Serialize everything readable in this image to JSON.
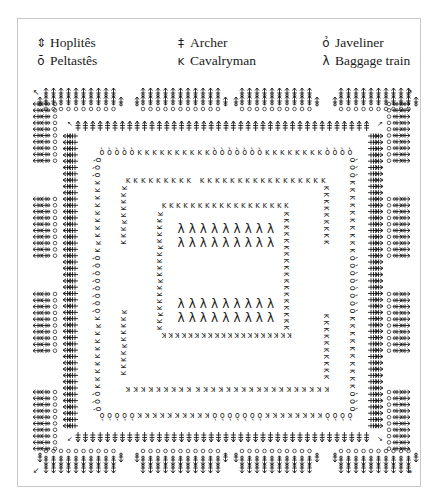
{
  "legend": {
    "items": [
      {
        "key": "hoplites",
        "glyph": "⇕",
        "label": "Hoplitês",
        "x": 0,
        "y": 0
      },
      {
        "key": "peltastes",
        "glyph": "ō",
        "label": "Peltastês",
        "x": 0,
        "y": 18
      },
      {
        "key": "archer",
        "glyph": "‡",
        "label": "Archer",
        "x": 140,
        "y": 0
      },
      {
        "key": "cavalryman",
        "glyph": "ĸ",
        "label": "Cavalryman",
        "x": 140,
        "y": 18
      },
      {
        "key": "javeliner",
        "glyph": "ỏ",
        "label": "Javeliner",
        "x": 285,
        "y": 0
      },
      {
        "key": "baggage",
        "glyph": "λ",
        "label": "Baggage train",
        "x": 285,
        "y": 18
      }
    ]
  },
  "formation": {
    "description": "Hollow-square marching formation",
    "outer_blocks_top": [
      {
        "x": 40,
        "n": 10
      },
      {
        "x": 137,
        "n": 11
      },
      {
        "x": 236,
        "n": 10
      },
      {
        "x": 335,
        "n": 10
      }
    ],
    "outer_blocks_bottom": [
      {
        "x": 40,
        "n": 10
      },
      {
        "x": 137,
        "n": 11
      },
      {
        "x": 236,
        "n": 10
      },
      {
        "x": 335,
        "n": 10
      }
    ],
    "outer_blocks_left": [
      {
        "y": 100,
        "n": 10
      },
      {
        "y": 195,
        "n": 10
      },
      {
        "y": 290,
        "n": 10
      },
      {
        "y": 388,
        "n": 10
      }
    ],
    "outer_blocks_right": [
      {
        "y": 100,
        "n": 10
      },
      {
        "y": 195,
        "n": 10
      },
      {
        "y": 290,
        "n": 10
      },
      {
        "y": 388,
        "n": 10
      }
    ],
    "archer_square": {
      "x1": 68,
      "y1": 126,
      "x2": 378,
      "y2": 437
    },
    "javeliner_square": {
      "x1": 98,
      "y1": 152,
      "x2": 352,
      "y2": 415
    },
    "cavalry_square": {
      "x1": 124,
      "y1": 180,
      "x2": 326,
      "y2": 389
    },
    "inner_cavalry_square": {
      "x1": 160,
      "y1": 205,
      "x2": 286,
      "y2": 335
    },
    "baggage_rows": [
      {
        "y": 229,
        "x": 181,
        "n": 9
      },
      {
        "y": 243,
        "x": 181,
        "n": 9
      },
      {
        "y": 304,
        "x": 181,
        "n": 9
      },
      {
        "y": 318,
        "x": 181,
        "n": 9
      }
    ]
  }
}
